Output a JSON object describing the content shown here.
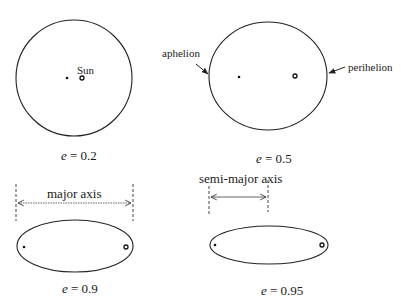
{
  "colors": {
    "stroke": "#222222",
    "background": "#ffffff",
    "guide": "#555555"
  },
  "orbits": [
    {
      "eccentricity_label": "e = 0.2",
      "e_symbol": "e",
      "e_value": " = 0.2",
      "sun_label": "Sun"
    },
    {
      "eccentricity_label": "e = 0.5",
      "e_symbol": "e",
      "e_value": " = 0.5",
      "aphelion_label": "aphelion",
      "perihelion_label": "perihelion"
    },
    {
      "eccentricity_label": "e = 0.9",
      "e_symbol": "e",
      "e_value": " = 0.9",
      "axis_label": "major axis"
    },
    {
      "eccentricity_label": "e = 0.95",
      "e_symbol": "e",
      "e_value": " = 0.95",
      "axis_label": "semi-major axis"
    }
  ]
}
